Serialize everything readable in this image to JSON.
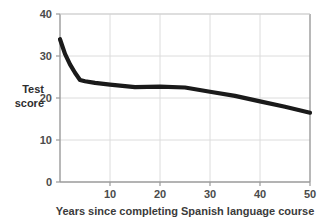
{
  "chart_data": {
    "type": "line",
    "title": "",
    "xlabel": "Years since completing Spanish language course",
    "ylabel": "Test score",
    "ylabel_line1": "Test",
    "ylabel_line2": "score",
    "xlim": [
      0,
      50
    ],
    "ylim": [
      0,
      40
    ],
    "grid": true,
    "legend": "none",
    "line_color": "#1a1a1a",
    "grid_color": "#d9d9d9",
    "axis_color": "#8c8c8c",
    "xticks": [
      10,
      20,
      30,
      40,
      50
    ],
    "xtick_labels": [
      "10",
      "20",
      "30",
      "40",
      "50"
    ],
    "yticks": [
      0,
      10,
      20,
      30,
      40
    ],
    "ytick_labels": [
      "0",
      "10",
      "20",
      "30",
      "40"
    ],
    "series": [
      {
        "name": "Test score",
        "x": [
          0,
          1,
          2,
          3,
          4,
          5,
          7,
          10,
          15,
          20,
          25,
          30,
          35,
          40,
          45,
          50
        ],
        "values": [
          34.0,
          30.5,
          28.0,
          26.0,
          24.3,
          24.0,
          23.6,
          23.2,
          22.6,
          22.7,
          22.5,
          21.5,
          20.5,
          19.2,
          17.9,
          16.5
        ]
      }
    ]
  },
  "axis_ticks": {
    "x": [
      {
        "label": "10",
        "value": 10
      },
      {
        "label": "20",
        "value": 20
      },
      {
        "label": "30",
        "value": 30
      },
      {
        "label": "40",
        "value": 40
      },
      {
        "label": "50",
        "value": 50
      }
    ],
    "y": [
      {
        "label": "40",
        "value": 40
      },
      {
        "label": "30",
        "value": 30
      },
      {
        "label": "20",
        "value": 20
      },
      {
        "label": "10",
        "value": 10
      },
      {
        "label": "0",
        "value": 0
      }
    ]
  }
}
